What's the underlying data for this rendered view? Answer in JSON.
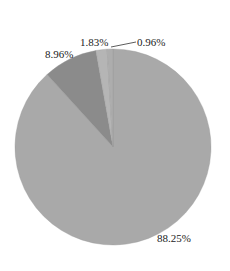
{
  "chart_data": {
    "type": "pie",
    "title": "",
    "start_angle_deg": 0,
    "direction": "clockwise",
    "slices": [
      {
        "label": "88.25%",
        "value": 88.25,
        "color": "#a9a9a9"
      },
      {
        "label": "8.96%",
        "value": 8.96,
        "color": "#8b8b8b"
      },
      {
        "label": "1.83%",
        "value": 1.83,
        "color": "#b5b5b5"
      },
      {
        "label": "0.96%",
        "value": 0.96,
        "color": "#adadad"
      }
    ],
    "legend": "none"
  },
  "labels": {
    "l0": "88.25%",
    "l1": "8.96%",
    "l2": "1.83%",
    "l3": "0.96%"
  }
}
